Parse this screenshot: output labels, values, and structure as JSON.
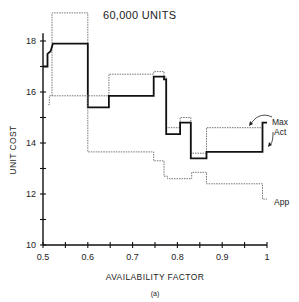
{
  "chart_data": {
    "type": "line",
    "subtype": "step",
    "title": "60,000 UNITS",
    "xlabel": "AVAILABILITY FACTOR",
    "ylabel": "UNIT COST",
    "caption": "(a)",
    "xlim": [
      0.5,
      1.0
    ],
    "ylim": [
      10,
      19.2
    ],
    "xticks": [
      0.5,
      0.55,
      0.6,
      0.65,
      0.7,
      0.75,
      0.8,
      0.85,
      0.9,
      0.95,
      1.0
    ],
    "xtick_labels": [
      "0.5",
      "",
      "0.6",
      "",
      "0.7",
      "",
      "0.8",
      "",
      "0.9",
      "",
      "1"
    ],
    "yticks": [
      10,
      11,
      12,
      13,
      14,
      15,
      16,
      17,
      18
    ],
    "ytick_labels": [
      "10",
      "",
      "12",
      "",
      "14",
      "",
      "16",
      "",
      "18"
    ],
    "grid": false,
    "series": [
      {
        "name": "Max",
        "style": "dotted",
        "points": [
          [
            0.52,
            15.85
          ],
          [
            0.52,
            19.1
          ],
          [
            0.6,
            19.1
          ],
          [
            0.6,
            15.85
          ],
          [
            0.647,
            15.85
          ],
          [
            0.647,
            16.7
          ],
          [
            0.747,
            16.7
          ],
          [
            0.747,
            16.8
          ],
          [
            0.77,
            16.8
          ],
          [
            0.77,
            16.6
          ],
          [
            0.775,
            16.6
          ],
          [
            0.775,
            14.6
          ],
          [
            0.806,
            14.6
          ],
          [
            0.806,
            15.0
          ],
          [
            0.83,
            15.0
          ],
          [
            0.83,
            13.6
          ],
          [
            0.865,
            13.6
          ],
          [
            0.865,
            14.6
          ],
          [
            0.99,
            14.6
          ]
        ]
      },
      {
        "name": "Act",
        "style": "solid-thick",
        "points": [
          [
            0.5,
            17.0
          ],
          [
            0.51,
            17.0
          ],
          [
            0.51,
            17.5
          ],
          [
            0.517,
            17.6
          ],
          [
            0.522,
            17.9
          ],
          [
            0.6,
            17.9
          ],
          [
            0.6,
            15.4
          ],
          [
            0.647,
            15.4
          ],
          [
            0.647,
            15.85
          ],
          [
            0.747,
            15.85
          ],
          [
            0.747,
            16.6
          ],
          [
            0.77,
            16.6
          ],
          [
            0.77,
            16.5
          ],
          [
            0.775,
            16.5
          ],
          [
            0.775,
            14.35
          ],
          [
            0.806,
            14.35
          ],
          [
            0.806,
            14.8
          ],
          [
            0.83,
            14.8
          ],
          [
            0.83,
            13.4
          ],
          [
            0.865,
            13.4
          ],
          [
            0.865,
            13.65
          ],
          [
            0.99,
            13.65
          ],
          [
            0.99,
            14.8
          ],
          [
            1.0,
            14.8
          ]
        ]
      },
      {
        "name": "App",
        "style": "dotted",
        "points": [
          [
            0.512,
            15.5
          ],
          [
            0.514,
            15.5
          ],
          [
            0.514,
            15.85
          ],
          [
            0.6,
            15.85
          ],
          [
            0.6,
            13.65
          ],
          [
            0.747,
            13.65
          ],
          [
            0.747,
            13.3
          ],
          [
            0.77,
            13.3
          ],
          [
            0.77,
            12.7
          ],
          [
            0.778,
            12.7
          ],
          [
            0.778,
            12.6
          ],
          [
            0.832,
            12.6
          ],
          [
            0.832,
            12.85
          ],
          [
            0.865,
            12.85
          ],
          [
            0.865,
            12.4
          ],
          [
            0.99,
            12.4
          ],
          [
            0.99,
            11.8
          ],
          [
            1.0,
            11.8
          ]
        ]
      }
    ],
    "annotations": [
      {
        "text": "Max",
        "target_series": "Max"
      },
      {
        "text": "Act",
        "target_series": "Act"
      },
      {
        "text": "App",
        "target_series": "App"
      }
    ]
  },
  "labels": {
    "title": "60,000 UNITS",
    "xlabel": "AVAILABILITY FACTOR",
    "ylabel": "UNIT COST",
    "caption": "(a)",
    "legend_max": "Max",
    "legend_act": "Act",
    "legend_app": "App"
  }
}
